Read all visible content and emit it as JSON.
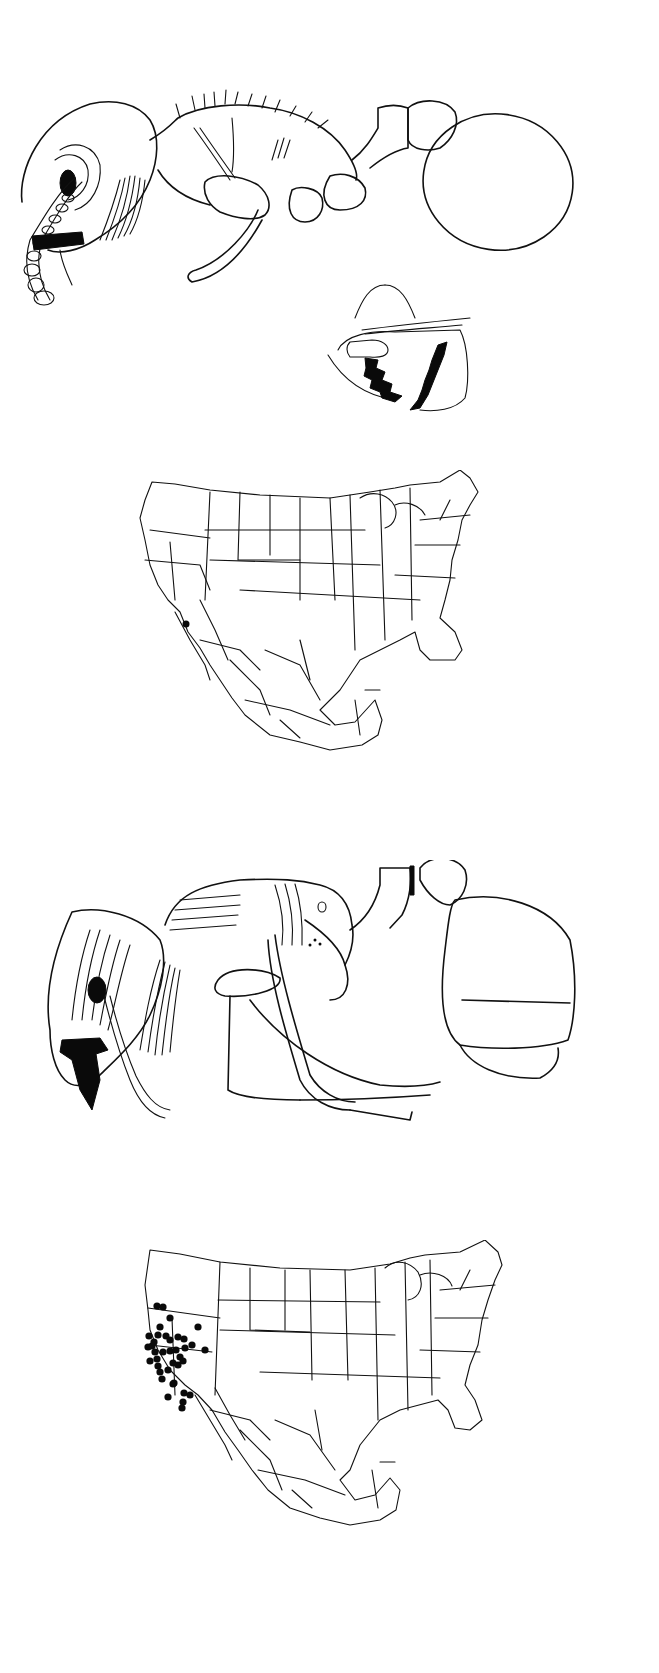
{
  "plate": {
    "background": "#ffffff",
    "ink_color": "#111111",
    "panels": [
      {
        "id": "worker-lateral",
        "subject": "ant worker, lateral view (head, mesosoma, petiole, postpetiole, gaster)"
      },
      {
        "id": "mandible-detail",
        "subject": "head/mandible detail with dentition"
      },
      {
        "id": "distribution-map-1",
        "subject": "map of USA and Mexico with state borders",
        "record_count": 1
      },
      {
        "id": "queen-lateral",
        "subject": "ant queen / gyne, lateral view with striate sculpture"
      },
      {
        "id": "distribution-map-2",
        "subject": "map of USA and Mexico with state borders",
        "record_count": 38
      }
    ]
  },
  "maps": {
    "map1": {
      "markers": [
        {
          "x": 186,
          "y": 624
        }
      ]
    },
    "map2": {
      "markers": [
        [
          157,
          1306
        ],
        [
          163,
          1307
        ],
        [
          170,
          1318
        ],
        [
          158,
          1335
        ],
        [
          166,
          1336
        ],
        [
          170,
          1340
        ],
        [
          178,
          1337
        ],
        [
          184,
          1339
        ],
        [
          198,
          1327
        ],
        [
          205,
          1350
        ],
        [
          163,
          1352
        ],
        [
          170,
          1351
        ],
        [
          149,
          1336
        ],
        [
          152,
          1346
        ],
        [
          155,
          1352
        ],
        [
          157,
          1359
        ],
        [
          158,
          1366
        ],
        [
          160,
          1372
        ],
        [
          162,
          1379
        ],
        [
          168,
          1370
        ],
        [
          176,
          1350
        ],
        [
          180,
          1357
        ],
        [
          185,
          1348
        ],
        [
          178,
          1365
        ],
        [
          173,
          1363
        ],
        [
          183,
          1361
        ],
        [
          173,
          1384
        ],
        [
          168,
          1397
        ],
        [
          184,
          1393
        ],
        [
          183,
          1402
        ],
        [
          182,
          1408
        ],
        [
          190,
          1395
        ],
        [
          174,
          1383
        ],
        [
          150,
          1361
        ],
        [
          148,
          1347
        ],
        [
          154,
          1342
        ],
        [
          160,
          1327
        ],
        [
          192,
          1345
        ]
      ]
    }
  }
}
